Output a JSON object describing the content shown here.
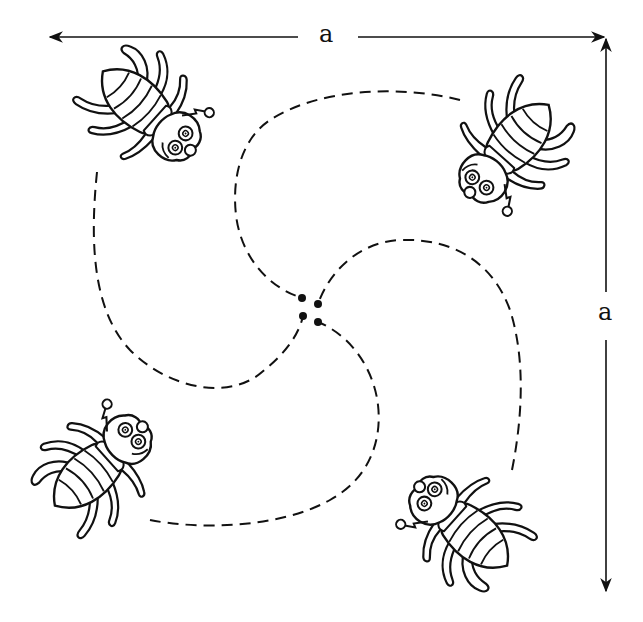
{
  "diagram": {
    "dimensions": {
      "top_label": "a",
      "right_label": "a"
    },
    "bugs": [
      {
        "id": "top-left",
        "position": "top-left corner",
        "facing": "toward center / down"
      },
      {
        "id": "top-right",
        "position": "top-right corner",
        "facing": "toward center / left"
      },
      {
        "id": "bottom-right",
        "position": "bottom-right corner",
        "facing": "toward center / up"
      },
      {
        "id": "bottom-left",
        "position": "bottom-left corner",
        "facing": "toward center / right"
      }
    ],
    "paths": [
      {
        "from": "top-left",
        "style": "dashed spiral",
        "ends_at_dot": "center-dot-3"
      },
      {
        "from": "top-right",
        "style": "dashed spiral",
        "ends_at_dot": "center-dot-1"
      },
      {
        "from": "bottom-right",
        "style": "dashed spiral",
        "ends_at_dot": "center-dot-2"
      },
      {
        "from": "bottom-left",
        "style": "dashed spiral",
        "ends_at_dot": "center-dot-4"
      }
    ],
    "colors": {
      "ink": "#111111",
      "background": "#ffffff"
    }
  }
}
